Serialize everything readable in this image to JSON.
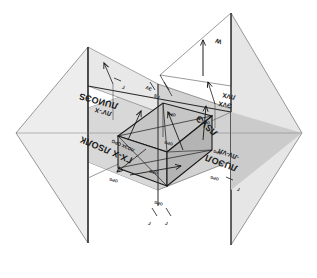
{
  "figure": {
    "type": "technical-line-drawing",
    "orientation_note": "scanned page, lettering rotated 180 degrees",
    "background_color": "#ffffff",
    "ink_color": "#1a1a1a"
  },
  "colors": {
    "horizontal_plane_fill": "#cfcfcf",
    "horizontal_plane_fill_light": "#d9d9d9",
    "vertical_plane_left_fill": "#ececec",
    "vertical_plane_right_fill": "#e4e4e4",
    "box_top_fill": "#c5c5c5",
    "box_front_fill": "#bdbdbd",
    "box_side_fill": "#b3b3b3",
    "outline": "#6e6e6e",
    "heavy_outline": "#1a1a1a",
    "paper": "#ffffff"
  },
  "planes": [
    {
      "name": "horizontal-plane",
      "label": "H"
    },
    {
      "name": "vertical-plane-left",
      "label": "V"
    },
    {
      "name": "vertical-plane-right",
      "label": "W"
    }
  ],
  "callout": {
    "name": "upper-right-callout",
    "symbol": "W",
    "arrow": "up"
  },
  "labels": {
    "top_left_block": {
      "line1": "ЛV'-X",
      "line2": "ЛUИOЭS"
    },
    "top_center_block": {
      "line1": "ГS",
      "line2": "ЭV",
      "line3": "OPG"
    },
    "top_right_block": {
      "line1": "ЭVX",
      "line2": "ЛVХ",
      "line3": "ЛSVЭ"
    },
    "left_block": {
      "line1": "ГХ-Х ЛSOЛК",
      "line2": "ЛOЭХ OPG"
    },
    "right_block": {
      "line1": "ЛUЭOЛ",
      "line2": "-ЛV-VЛ"
    },
    "box_center": "OPG",
    "box_marks": [
      "OPG",
      "OPG",
      "OPG",
      "OPG",
      "OPG",
      "OPG"
    ],
    "bottom_ticks": [
      "Г",
      "Г"
    ],
    "right_ticks": [
      "Г",
      "Г"
    ]
  },
  "vectors": [
    {
      "name": "vector-up-left",
      "direction": "up"
    },
    {
      "name": "vector-up-center",
      "direction": "up"
    },
    {
      "name": "vector-up-right",
      "direction": "up"
    },
    {
      "name": "vector-right-base",
      "direction": "right"
    },
    {
      "name": "vector-diag-down",
      "direction": "down-left"
    },
    {
      "name": "vector-callout-up",
      "direction": "up"
    }
  ],
  "box": {
    "name": "parallelepiped",
    "edges": 12,
    "diagonals": 4,
    "visible_faces": [
      "top",
      "front",
      "right-side"
    ]
  }
}
